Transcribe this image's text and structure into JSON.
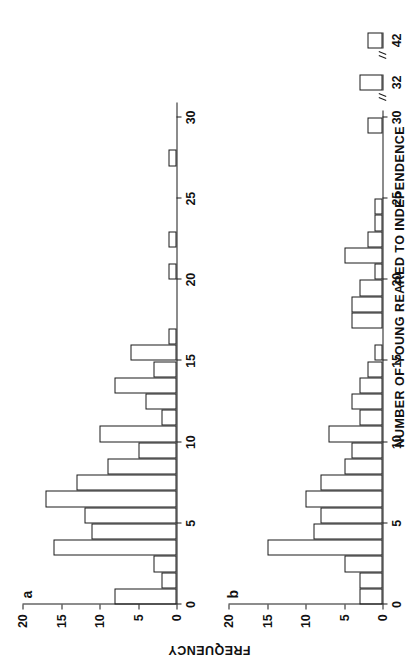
{
  "figure": {
    "xlabel": "NUMBER OF YOUNG REARED TO INDEPENDENCE",
    "ylabel": "FREQUENCY"
  },
  "panel_a": {
    "letter": "a",
    "y_ticklabels": [
      "0",
      "5",
      "10",
      "15",
      "20"
    ],
    "x_ticklabels": [
      "0",
      "5",
      "10",
      "15",
      "20",
      "25",
      "30"
    ]
  },
  "panel_b": {
    "letter": "b",
    "y_ticklabels": [
      "0",
      "5",
      "10",
      "15",
      "20"
    ],
    "x_ticklabels": [
      "0",
      "5",
      "10",
      "15",
      "20",
      "25",
      "30"
    ],
    "break_ticklabels": [
      "32",
      "42"
    ]
  },
  "chart_data": [
    {
      "type": "bar",
      "title": "a",
      "xlabel": "NUMBER OF YOUNG REARED TO INDEPENDENCE",
      "ylabel": "FREQUENCY",
      "xlim": [
        0,
        30
      ],
      "ylim": [
        0,
        20
      ],
      "grid": false,
      "categories": [
        0,
        1,
        2,
        3,
        4,
        5,
        6,
        7,
        8,
        9,
        10,
        11,
        12,
        13,
        14,
        15,
        16,
        17,
        18,
        19,
        20,
        21,
        22,
        23,
        24,
        25,
        26,
        27,
        28,
        29
      ],
      "values": [
        8,
        2,
        3,
        16,
        11,
        12,
        17,
        13,
        9,
        5,
        10,
        2,
        4,
        8,
        3,
        6,
        1,
        0,
        0,
        0,
        1,
        0,
        1,
        0,
        0,
        0,
        0,
        1,
        0,
        0
      ]
    },
    {
      "type": "bar",
      "title": "b",
      "xlabel": "NUMBER OF YOUNG REARED TO INDEPENDENCE",
      "ylabel": "FREQUENCY",
      "xlim": [
        0,
        30
      ],
      "ylim": [
        0,
        20
      ],
      "grid": false,
      "categories": [
        0,
        1,
        2,
        3,
        4,
        5,
        6,
        7,
        8,
        9,
        10,
        11,
        12,
        13,
        14,
        15,
        16,
        17,
        18,
        19,
        20,
        21,
        22,
        23,
        24,
        25,
        26,
        27,
        28,
        29
      ],
      "values": [
        3,
        3,
        5,
        15,
        9,
        8,
        10,
        8,
        5,
        4,
        7,
        3,
        4,
        3,
        2,
        1,
        0,
        4,
        4,
        3,
        1,
        5,
        2,
        1,
        1,
        0,
        0,
        0,
        0,
        2
      ],
      "break_categories": [
        32,
        42
      ],
      "break_values": [
        3,
        2
      ],
      "axis_break": true
    }
  ]
}
